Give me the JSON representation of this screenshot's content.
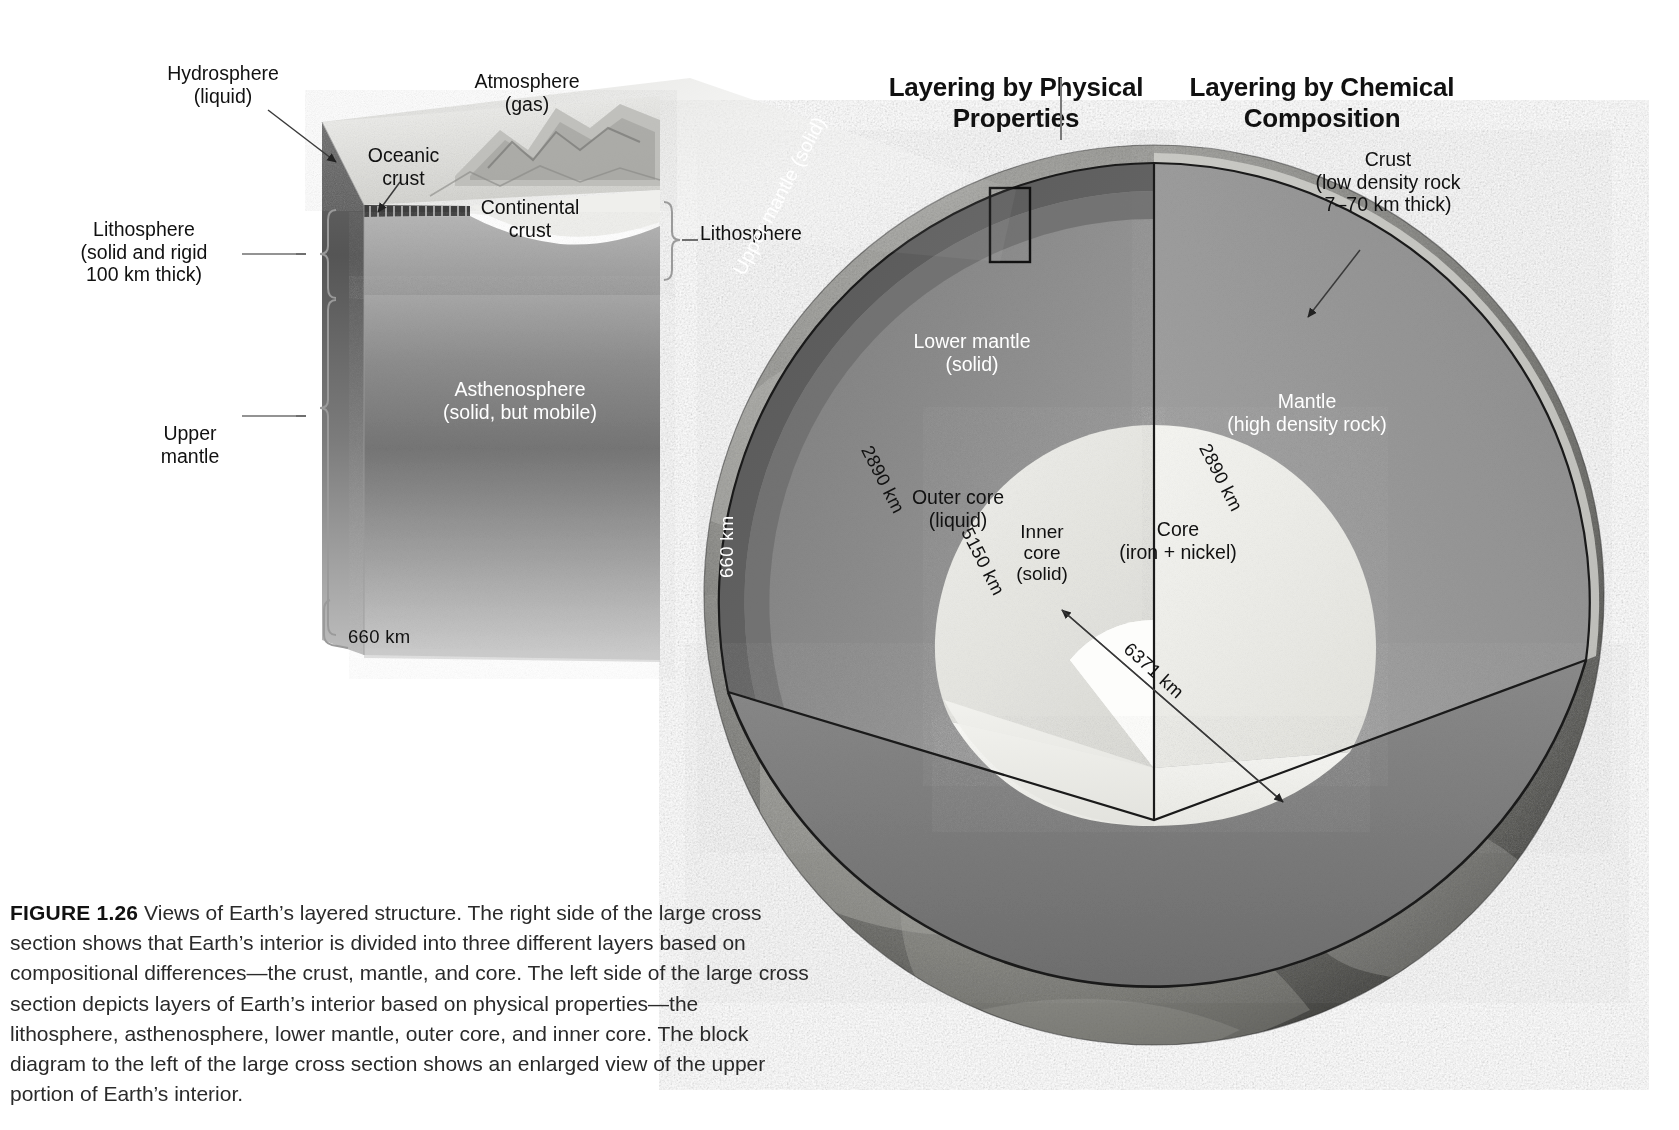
{
  "headings": {
    "left": "Layering by\nPhysical Properties",
    "right": "Layering by\nChemical Composition"
  },
  "block_diagram": {
    "hydrosphere": "Hydrosphere\n(liquid)",
    "atmosphere": "Atmosphere\n(gas)",
    "oceanic_crust": "Oceanic\ncrust",
    "continental_crust": "Continental\ncrust",
    "lithosphere_left": "Lithosphere\n(solid and rigid\n100 km thick)",
    "lithosphere_right": "Lithosphere",
    "asthenosphere": "Asthenosphere\n(solid, but mobile)",
    "upper_mantle": "Upper\nmantle",
    "depth_660": "660 km"
  },
  "globe": {
    "physical": {
      "upper_mantle": "Upper mantle (solid)",
      "lower_mantle": "Lower mantle\n(solid)",
      "outer_core": "Outer core\n(liquid)",
      "inner_core": "Inner\ncore\n(solid)",
      "depth_660": "660 km",
      "depth_2890": "2890 km",
      "depth_5150": "5150 km"
    },
    "chemical": {
      "crust": "Crust\n(low density rock\n7–70 km thick)",
      "mantle": "Mantle\n(high density rock)",
      "core": "Core\n(iron + nickel)",
      "depth_2890": "2890 km",
      "radius_6371": "6371 km"
    }
  },
  "caption": {
    "figure_number": "FIGURE 1.26",
    "text": "Views of Earth’s layered structure. The right side of the large cross section shows that Earth’s interior is divided into three different layers based on compositional differences—the crust, mantle, and core. The left side of the large cross section depicts layers of Earth’s interior based on physical properties—the lithosphere, asthenosphere, lower mantle, outer core, and inner core. The block diagram to the left of the large cross section shows an enlarged view of the upper portion of Earth’s interior."
  },
  "colors": {
    "mantle": "#8e8e8e",
    "upper_mantle_band": "#636363",
    "lower_mantle": "#8a8a8a",
    "outer_core": "#e8e8e4",
    "inner_core": "#fbfbf9",
    "core_right": "#f2f2ee",
    "cut_floor": "#7b7b7b",
    "surface_dark": "#5a5a5a",
    "asthenosphere": "#7d7d7d",
    "lithosphere_block": "#9a9a9a",
    "crust_light": "#f1f1ef",
    "leader_line": "#5a5a5a",
    "heading_text": "#111111"
  }
}
